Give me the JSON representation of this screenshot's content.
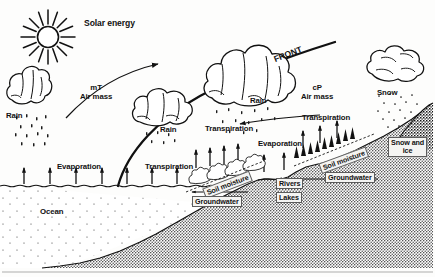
{
  "figure": {
    "type": "schematic-diagram",
    "width_px": 435,
    "height_px": 277,
    "style": "black-and-white line drawing with stippled/halftone shading"
  },
  "colors": {
    "ink": "#111111",
    "paper": "#fdfdfc",
    "ground_fill": "#b4b4b4",
    "ocean_fill": "#ffffff",
    "label_box": "#f4f4f2"
  },
  "labels": {
    "solar_energy": "Solar energy",
    "front": "FRONT",
    "mt_air_mass_line1": "mT",
    "mt_air_mass_line2": "Air mass",
    "cp_air_mass_line1": "cP",
    "cp_air_mass_line2": "Air mass",
    "rain_left": "Rain",
    "rain_center": "Rain",
    "rain_right": "Rain",
    "snow": "Snow",
    "evaporation_ocean": "Evaporation",
    "evaporation_land": "Evaporation",
    "transpiration_left": "Transpiration",
    "transpiration_center": "Transpiration",
    "transpiration_right": "Transpiration",
    "ocean": "Ocean",
    "soil_moisture_left": "Soil moisture",
    "soil_moisture_right": "Soil moisture",
    "groundwater_left": "Groundwater",
    "groundwater_right": "Groundwater",
    "rivers": "Rivers",
    "lakes": "Lakes",
    "snow_and_ice_line1": "Snow and",
    "snow_and_ice_line2": "ice"
  },
  "icons": {
    "sun": "sun-icon",
    "cloud_left": "cloud-icon",
    "cloud_center_low": "cloud-icon",
    "cloud_center_high": "cloud-icon",
    "cloud_right": "cloud-icon",
    "arrow_air_flow_upper": "arrow-right-icon",
    "arrow_air_flow_lower": "arrow-left-icon",
    "arrow_evaporation": "arrow-up-icon",
    "arrow_transpiration": "arrow-up-icon",
    "arrow_groundwater_left": "arrow-left-icon",
    "arrow_groundwater_right": "arrow-left-icon",
    "trees": "tree-cluster-icon",
    "rain_drops": "precipitation-icon",
    "snow_flakes": "precipitation-icon"
  },
  "components": {
    "reservoirs": [
      "Ocean",
      "Rivers",
      "Lakes",
      "Soil moisture",
      "Groundwater",
      "Snow and ice"
    ],
    "fluxes": [
      "Evaporation",
      "Transpiration",
      "Rain",
      "Snow"
    ],
    "atmosphere": [
      "mT Air mass",
      "cP Air mass",
      "FRONT",
      "Solar energy"
    ]
  }
}
